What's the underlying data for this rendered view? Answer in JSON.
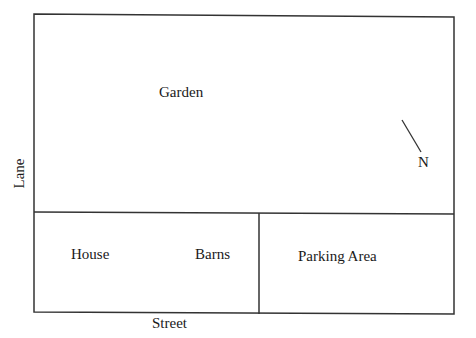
{
  "diagram": {
    "type": "site-plan",
    "regions": {
      "garden": "Garden",
      "house": "House",
      "barns": "Barns",
      "parking": "Parking Area"
    },
    "boundaries": {
      "left": "Lane",
      "bottom": "Street"
    },
    "compass": {
      "label": "N"
    },
    "colors": {
      "line": "#333333",
      "text": "#1a1a1a",
      "background": "#ffffff"
    }
  }
}
